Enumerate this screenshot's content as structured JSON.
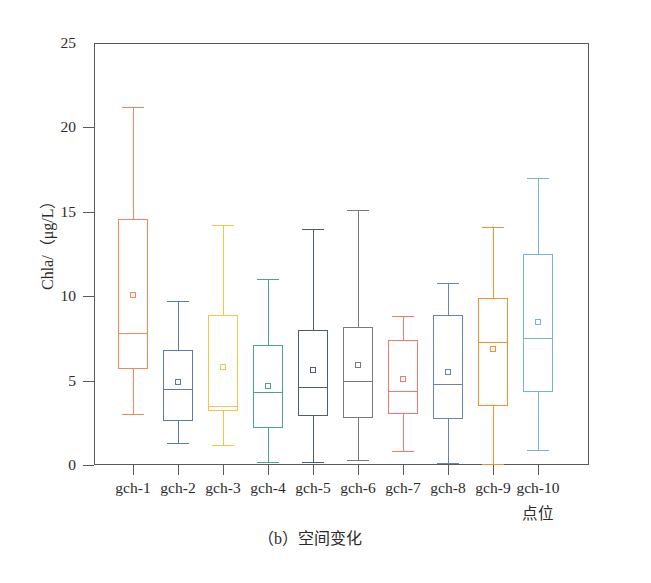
{
  "figure": {
    "caption": "（b）空间变化",
    "y_axis_label": "Chla/（μg/L）",
    "x_axis_label": "点位"
  },
  "chart_data": {
    "type": "box",
    "title": "（b）空间变化",
    "xlabel": "点位",
    "ylabel": "Chla/（μg/L）",
    "ylim": [
      0,
      25
    ],
    "yticks": [
      0,
      5,
      10,
      15,
      20,
      25
    ],
    "grid": false,
    "legend": "none",
    "categories": [
      "gch-1",
      "gch-2",
      "gch-3",
      "gch-4",
      "gch-5",
      "gch-6",
      "gch-7",
      "gch-8",
      "gch-9",
      "gch-10"
    ],
    "boxes": [
      {
        "category": "gch-1",
        "whisker_low": 3.0,
        "q1": 5.7,
        "median": 7.8,
        "mean": 10.1,
        "q3": 14.6,
        "whisker_high": 21.2,
        "color": "#f08a5d"
      },
      {
        "category": "gch-2",
        "whisker_low": 1.3,
        "q1": 2.6,
        "median": 4.5,
        "mean": 4.9,
        "q3": 6.8,
        "whisker_high": 9.7,
        "color": "#5b7ca6"
      },
      {
        "category": "gch-3",
        "whisker_low": 1.2,
        "q1": 3.2,
        "median": 3.5,
        "mean": 5.8,
        "q3": 8.9,
        "whisker_high": 14.2,
        "color": "#f3c44a"
      },
      {
        "category": "gch-4",
        "whisker_low": 0.2,
        "q1": 2.2,
        "median": 4.3,
        "mean": 4.7,
        "q3": 7.1,
        "whisker_high": 11.0,
        "color": "#4aa58a"
      },
      {
        "category": "gch-5",
        "whisker_low": 0.2,
        "q1": 2.9,
        "median": 4.6,
        "mean": 5.6,
        "q3": 8.0,
        "whisker_high": 14.0,
        "color": "#4b5d72"
      },
      {
        "category": "gch-6",
        "whisker_low": 0.3,
        "q1": 2.8,
        "median": 5.0,
        "mean": 5.9,
        "q3": 8.2,
        "whisker_high": 15.1,
        "color": "#7a7a7a"
      },
      {
        "category": "gch-7",
        "whisker_low": 0.8,
        "q1": 3.0,
        "median": 4.4,
        "mean": 5.1,
        "q3": 7.4,
        "whisker_high": 8.8,
        "color": "#f07a70"
      },
      {
        "category": "gch-8",
        "whisker_low": 0.1,
        "q1": 2.7,
        "median": 4.8,
        "mean": 5.5,
        "q3": 8.9,
        "whisker_high": 10.8,
        "color": "#6787a8"
      },
      {
        "category": "gch-9",
        "whisker_low": 0.05,
        "q1": 3.5,
        "median": 7.3,
        "mean": 6.9,
        "q3": 9.9,
        "whisker_high": 14.1,
        "color": "#f09234"
      },
      {
        "category": "gch-10",
        "whisker_low": 0.9,
        "q1": 4.3,
        "median": 7.5,
        "mean": 8.5,
        "q3": 12.5,
        "whisker_high": 17.0,
        "color": "#74b4cf"
      }
    ]
  }
}
